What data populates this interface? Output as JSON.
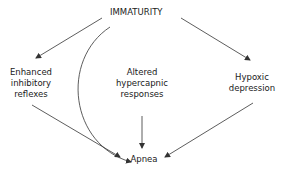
{
  "diagram": {
    "colors": {
      "stroke": "#333333",
      "text": "#1a1a1a",
      "background": "#ffffff"
    },
    "nodes": {
      "root": {
        "label": "IMMATURITY"
      },
      "left": {
        "line1": "Enhanced",
        "line2": "inhibitory",
        "line3": "reflexes"
      },
      "middle": {
        "line1": "Altered",
        "line2": "hypercapnic",
        "line3": "responses"
      },
      "right": {
        "line1": "Hypoxic",
        "line2": "depression"
      },
      "target": {
        "label": "Apnea"
      }
    },
    "edges": [
      {
        "from": "IMMATURITY",
        "to": "Enhanced inhibitory reflexes"
      },
      {
        "from": "IMMATURITY",
        "to": "Hypoxic depression"
      },
      {
        "from": "IMMATURITY",
        "to": "Apnea",
        "style": "curved"
      },
      {
        "from": "Enhanced inhibitory reflexes",
        "to": "Apnea"
      },
      {
        "from": "Altered hypercapnic responses",
        "to": "Apnea"
      },
      {
        "from": "Hypoxic depression",
        "to": "Apnea"
      }
    ]
  }
}
